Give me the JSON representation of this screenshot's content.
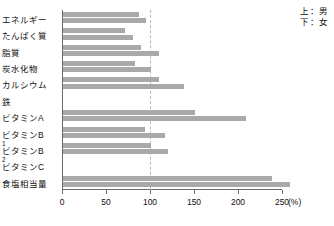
{
  "legend": {
    "upper": "上：男",
    "lower": "下：女"
  },
  "axis": {
    "unit": "(%)",
    "ticks": [
      "0",
      "50",
      "100",
      "150",
      "200",
      "250"
    ]
  },
  "chart_data": {
    "type": "bar",
    "orientation": "horizontal",
    "title": "",
    "xlabel": "(%)",
    "ylabel": "",
    "xlim": [
      0,
      250
    ],
    "grid": false,
    "reference_line": 100,
    "legend_position": "top-right",
    "categories": [
      "エネルギー",
      "たんぱく質",
      "脂質",
      "炭水化物",
      "カルシウム",
      "鉄",
      "ビタミンA",
      "ビタミンB1",
      "ビタミンB2",
      "ビタミンC",
      "食塩相当量"
    ],
    "series": [
      {
        "name": "上：男",
        "values": [
          86,
          70,
          89,
          82,
          109,
          0,
          150,
          93,
          100,
          0,
          238
        ]
      },
      {
        "name": "下：女",
        "values": [
          94,
          80,
          109,
          100,
          137,
          0,
          208,
          116,
          119,
          0,
          258
        ]
      }
    ]
  },
  "colors": {
    "bar": "#a9a9a9",
    "axis": "#6b6b6b",
    "reference": "#b9b9b9",
    "text": "#111111"
  }
}
